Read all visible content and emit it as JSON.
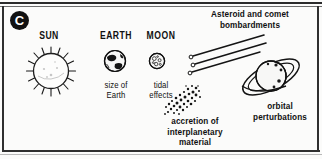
{
  "figure": {
    "panel_letter": "C",
    "background_color": "#fbfbfa",
    "ink_color": "#101010"
  },
  "headings": [
    {
      "id": "sun",
      "label": "SUN"
    },
    {
      "id": "earth",
      "label": "EARTH"
    },
    {
      "id": "moon",
      "label": "MOON"
    }
  ],
  "captions": {
    "earth": "size of\nEarth",
    "moon": "tidal\neffects",
    "asteroid": "Asteroid and comet\nbombardments",
    "accretion": "accretion of\ninterplanetary\nmaterial",
    "orbital": "orbital\nperturbations"
  },
  "icons": {
    "sun": "sun-with-rays-icon",
    "earth": "earth-globe-icon",
    "moon": "cratered-moon-icon",
    "comets": "comet-streaks-icon",
    "accretion": "scattered-particles-icon",
    "planet": "ringed-planet-icon"
  }
}
